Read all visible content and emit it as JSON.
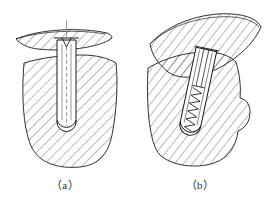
{
  "figure": {
    "background_color": "#ffffff",
    "line_color": "#1b1b1b",
    "hatch_color": "#3a3a3a",
    "centerline_color": "#8a8a8a",
    "width": 270,
    "height": 205
  },
  "subfigures": [
    {
      "id": "a",
      "caption": "（a）",
      "description": "bolt seated straight in hole, members aligned",
      "parts": {
        "upper_plate": "crescent-shaped hatched plate, horizontal",
        "lower_body": "large hatched block with rounded bottom hole",
        "fastener": "smooth-shank bolt with flat head and V notch",
        "centerline": "vertical dashed centerline through bolt axis",
        "hole_bottom": "semicircular rounded hole end"
      }
    },
    {
      "id": "b",
      "caption": "（b）",
      "description": "threaded screw in tilted members, thread engaged",
      "parts": {
        "upper_plate": "crescent-shaped hatched plate, tilted",
        "lower_body": "hatched block with stepped right edge",
        "fastener": "inclined screw with zig-zag thread profile",
        "hole_bottom": "rounded hole end with threads"
      }
    }
  ],
  "hatching": {
    "angle_degrees": 45,
    "spacing_px": 7,
    "stroke_width": 0.7
  }
}
